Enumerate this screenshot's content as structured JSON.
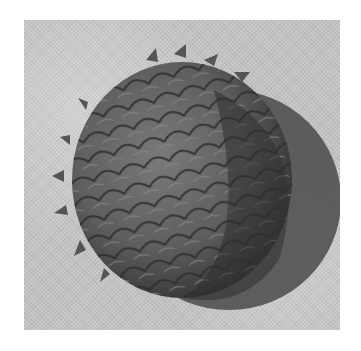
{
  "image": {
    "subject": "pine cone",
    "style": "grayscale halftone photograph",
    "background": "light gray textured surface",
    "colors": {
      "border": "#ffffff",
      "background": "#c9c9c9",
      "cone_mid": "#6a6a6a",
      "cone_dark": "#3a3a3a",
      "shadow": "#4a4a4a"
    }
  }
}
